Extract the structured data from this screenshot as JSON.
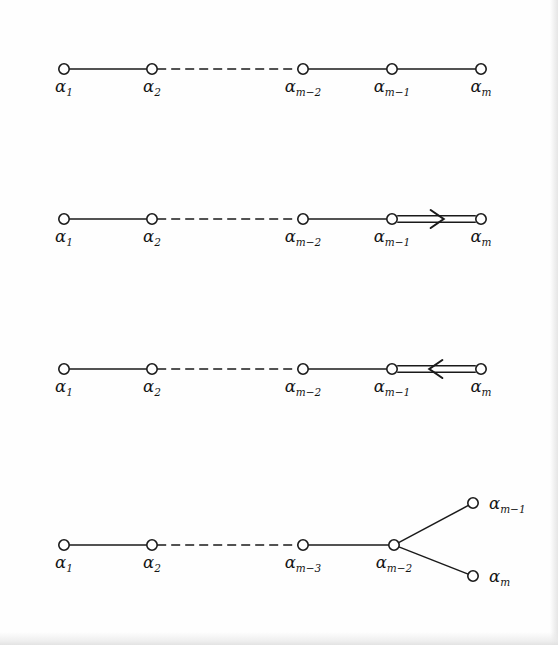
{
  "page": {
    "background_color": "#fefefe",
    "ink_color": "#1a1a1a",
    "width": 558,
    "height": 645
  },
  "diagrams": [
    {
      "id": "diagram-a-series",
      "name": "simple-chain-diagram",
      "row": 1,
      "baseline_y": 69,
      "nodes": [
        {
          "label_alpha": "α",
          "label_sub": "1",
          "x": 64,
          "y": 69
        },
        {
          "label_alpha": "α",
          "label_sub": "2",
          "x": 152,
          "y": 69
        },
        {
          "label_alpha": "α",
          "label_sub": "m−2",
          "x": 303,
          "y": 69
        },
        {
          "label_alpha": "α",
          "label_sub": "m−1",
          "x": 392,
          "y": 69
        },
        {
          "label_alpha": "α",
          "label_sub": "m",
          "x": 481,
          "y": 69
        }
      ],
      "edges": [
        {
          "from": 0,
          "to": 1,
          "style": "solid"
        },
        {
          "from": 1,
          "to": 2,
          "style": "dashed"
        },
        {
          "from": 2,
          "to": 3,
          "style": "solid"
        },
        {
          "from": 3,
          "to": 4,
          "style": "solid"
        }
      ]
    },
    {
      "id": "diagram-b-series",
      "name": "double-bond-arrow-right-diagram",
      "row": 2,
      "baseline_y": 219,
      "nodes": [
        {
          "label_alpha": "α",
          "label_sub": "1",
          "x": 64,
          "y": 219
        },
        {
          "label_alpha": "α",
          "label_sub": "2",
          "x": 152,
          "y": 219
        },
        {
          "label_alpha": "α",
          "label_sub": "m−2",
          "x": 303,
          "y": 219
        },
        {
          "label_alpha": "α",
          "label_sub": "m−1",
          "x": 392,
          "y": 219
        },
        {
          "label_alpha": "α",
          "label_sub": "m",
          "x": 481,
          "y": 219
        }
      ],
      "edges": [
        {
          "from": 0,
          "to": 1,
          "style": "solid"
        },
        {
          "from": 1,
          "to": 2,
          "style": "dashed"
        },
        {
          "from": 2,
          "to": 3,
          "style": "solid"
        },
        {
          "from": 3,
          "to": 4,
          "style": "double",
          "arrow": "right"
        }
      ]
    },
    {
      "id": "diagram-c-series",
      "name": "double-bond-arrow-left-diagram",
      "row": 3,
      "baseline_y": 369,
      "nodes": [
        {
          "label_alpha": "α",
          "label_sub": "1",
          "x": 64,
          "y": 369
        },
        {
          "label_alpha": "α",
          "label_sub": "2",
          "x": 152,
          "y": 369
        },
        {
          "label_alpha": "α",
          "label_sub": "m−2",
          "x": 303,
          "y": 369
        },
        {
          "label_alpha": "α",
          "label_sub": "m−1",
          "x": 392,
          "y": 369
        },
        {
          "label_alpha": "α",
          "label_sub": "m",
          "x": 481,
          "y": 369
        }
      ],
      "edges": [
        {
          "from": 0,
          "to": 1,
          "style": "solid"
        },
        {
          "from": 1,
          "to": 2,
          "style": "dashed"
        },
        {
          "from": 2,
          "to": 3,
          "style": "solid"
        },
        {
          "from": 3,
          "to": 4,
          "style": "double",
          "arrow": "left"
        }
      ]
    },
    {
      "id": "diagram-d-series",
      "name": "forked-chain-diagram",
      "row": 4,
      "baseline_y": 545,
      "nodes": [
        {
          "label_alpha": "α",
          "label_sub": "1",
          "x": 64,
          "y": 545,
          "label_pos": "below"
        },
        {
          "label_alpha": "α",
          "label_sub": "2",
          "x": 152,
          "y": 545,
          "label_pos": "below"
        },
        {
          "label_alpha": "α",
          "label_sub": "m−3",
          "x": 303,
          "y": 545,
          "label_pos": "below"
        },
        {
          "label_alpha": "α",
          "label_sub": "m−2",
          "x": 394,
          "y": 545,
          "label_pos": "below"
        },
        {
          "label_alpha": "α",
          "label_sub": "m−1",
          "x": 473,
          "y": 503,
          "label_pos": "right"
        },
        {
          "label_alpha": "α",
          "label_sub": "m",
          "x": 473,
          "y": 576,
          "label_pos": "right"
        }
      ],
      "edges": [
        {
          "from": 0,
          "to": 1,
          "style": "solid"
        },
        {
          "from": 1,
          "to": 2,
          "style": "dashed"
        },
        {
          "from": 2,
          "to": 3,
          "style": "solid"
        },
        {
          "from": 3,
          "to": 4,
          "style": "solid"
        },
        {
          "from": 3,
          "to": 5,
          "style": "solid"
        }
      ]
    }
  ],
  "geometry": {
    "node_radius": 5.2,
    "double_bond_gap": 3.2,
    "label_offset_below_y": 23,
    "label_offset_right_x": 16
  }
}
